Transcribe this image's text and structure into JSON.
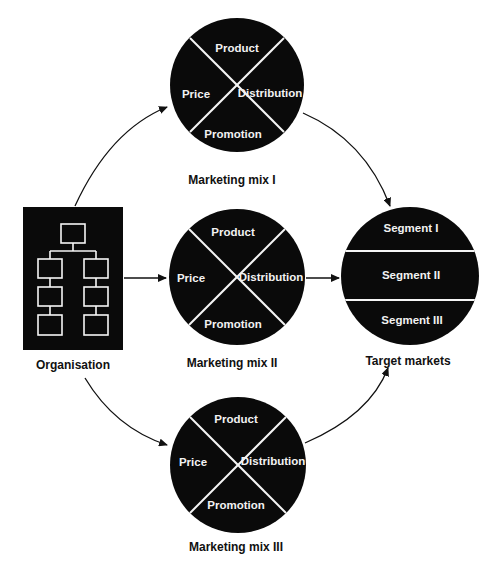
{
  "colors": {
    "fill": "#0a0a0a",
    "divider": "#f5f5f5",
    "background": "#ffffff",
    "arrow": "#111111"
  },
  "organisation": {
    "label": "Organisation",
    "icon": "org-chart-icon"
  },
  "mixes": [
    {
      "label": "Marketing mix I",
      "quadrants": {
        "top": "Product",
        "left": "Price",
        "right": "Distribution",
        "bottom": "Promotion"
      }
    },
    {
      "label": "Marketing mix II",
      "quadrants": {
        "top": "Product",
        "left": "Price",
        "right": "Distribution",
        "bottom": "Promotion"
      }
    },
    {
      "label": "Marketing mix III",
      "quadrants": {
        "top": "Product",
        "left": "Price",
        "right": "Distribution",
        "bottom": "Promotion"
      }
    }
  ],
  "target": {
    "label": "Target markets",
    "segments": [
      "Segment I",
      "Segment II",
      "Segment III"
    ]
  }
}
